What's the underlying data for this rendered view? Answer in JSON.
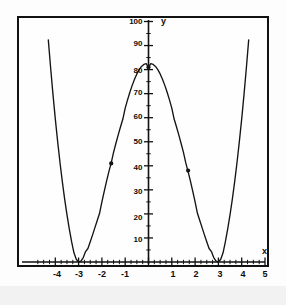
{
  "figure": {
    "title": "",
    "x_axis_name": "x",
    "y_axis_name": "y"
  },
  "chart_data": {
    "type": "line",
    "title": "",
    "subtitle": "",
    "xlabel": "x",
    "ylabel": "y",
    "xlim": [
      -4.6,
      5.3
    ],
    "ylim": [
      0,
      103
    ],
    "grid": false,
    "legend": null,
    "function": "y = (x^2 - 9)^2",
    "x_ticks": [
      -4,
      -3,
      -2,
      -1,
      1,
      2,
      3,
      4,
      5
    ],
    "x_tick_labels": [
      "-4",
      "-3",
      "-2",
      "-1",
      "1",
      "2",
      "3",
      "4",
      "5"
    ],
    "y_ticks": [
      10,
      20,
      30,
      40,
      50,
      60,
      70,
      80,
      90,
      100
    ],
    "y_tick_labels": [
      "10",
      "20",
      "30",
      "40",
      "50",
      "60",
      "70",
      "80",
      "90",
      "100"
    ],
    "x_minor_tick_step": 0.25,
    "y_minor_tick_step": 5,
    "series": [
      {
        "name": "y = (x^2 - 9)^2",
        "x": [
          -4.3,
          -4.2,
          -4.1,
          -4.0,
          -3.9,
          -3.8,
          -3.7,
          -3.6,
          -3.5,
          -3.4,
          -3.3,
          -3.2,
          -3.1,
          -3.0,
          -2.9,
          -2.8,
          -2.7,
          -2.6,
          -2.5,
          -2.4,
          -2.3,
          -2.2,
          -2.1,
          -2.0,
          -1.9,
          -1.8,
          -1.7,
          -1.6,
          -1.5,
          -1.4,
          -1.3,
          -1.2,
          -1.1,
          -1.0,
          -0.9,
          -0.8,
          -0.7,
          -0.6,
          -0.5,
          -0.4,
          -0.3,
          -0.2,
          -0.1,
          0.0,
          0.1,
          0.2,
          0.3,
          0.4,
          0.5,
          0.6,
          0.7,
          0.8,
          0.9,
          1.0,
          1.1,
          1.2,
          1.3,
          1.4,
          1.5,
          1.6,
          1.7,
          1.8,
          1.9,
          2.0,
          2.1,
          2.2,
          2.3,
          2.4,
          2.5,
          2.6,
          2.7,
          2.8,
          2.9,
          3.0,
          3.1,
          3.2,
          3.3,
          3.4,
          3.5,
          3.6,
          3.7,
          3.8,
          3.9,
          4.0,
          4.1,
          4.2,
          4.3
        ],
        "y": [
          92.35,
          80.64,
          69.72,
          59.52,
          50.13,
          41.47,
          33.52,
          26.27,
          19.69,
          13.76,
          8.47,
          3.81,
          1.16,
          0.0,
          0.34,
          1.85,
          4.34,
          5.62,
          8.44,
          11.29,
          14.29,
          17.23,
          20.25,
          25.0,
          29.38,
          33.64,
          37.6,
          41.21,
          45.56,
          49.28,
          52.85,
          56.25,
          59.45,
          64.0,
          67.4,
          70.56,
          73.44,
          76.0,
          78.2,
          79.99,
          81.32,
          82.16,
          82.45,
          81.0,
          82.45,
          82.16,
          81.32,
          79.99,
          78.2,
          76.0,
          73.44,
          70.56,
          67.4,
          64.0,
          59.45,
          56.25,
          52.85,
          49.28,
          45.56,
          41.21,
          37.6,
          33.64,
          29.38,
          25.0,
          20.25,
          17.23,
          14.29,
          11.29,
          8.44,
          5.62,
          4.34,
          1.85,
          0.34,
          0.0,
          1.16,
          3.81,
          8.47,
          13.76,
          19.69,
          26.27,
          33.52,
          41.47,
          50.13,
          59.52,
          69.72,
          80.64,
          92.35
        ]
      }
    ],
    "marked_points": [
      {
        "x": 0,
        "y": 81,
        "label": ""
      },
      {
        "x": -1.6,
        "y": 41,
        "label": ""
      },
      {
        "x": 1.7,
        "y": 38,
        "label": ""
      }
    ],
    "roots": [
      -3,
      3
    ],
    "vertex_local_max": {
      "x": 0,
      "y": 81
    },
    "colors": {
      "curve": "#141414",
      "axis": "#111111",
      "frame": "#121212",
      "background": "#fefefe",
      "text": "#0d0d0d"
    }
  },
  "y_axis_labels": [
    {
      "value": "100",
      "y": 22
    },
    {
      "value": "90",
      "y": 44
    },
    {
      "value": "80",
      "y": 71
    },
    {
      "value": "70",
      "y": 93
    },
    {
      "value": "60",
      "y": 117
    },
    {
      "value": "50",
      "y": 142
    },
    {
      "value": "40",
      "y": 168
    },
    {
      "value": "30",
      "y": 192
    },
    {
      "value": "20",
      "y": 218
    },
    {
      "value": "10",
      "y": 240
    }
  ],
  "x_axis_labels": [
    {
      "value": "-4",
      "x": 57
    },
    {
      "value": "-3",
      "x": 79
    },
    {
      "value": "-2",
      "x": 102
    },
    {
      "value": "-1",
      "x": 125
    },
    {
      "value": "1",
      "x": 173
    },
    {
      "value": "2",
      "x": 196
    },
    {
      "value": "3",
      "x": 220
    },
    {
      "value": "4",
      "x": 243
    },
    {
      "value": "5",
      "x": 265
    }
  ]
}
